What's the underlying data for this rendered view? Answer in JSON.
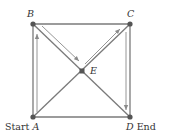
{
  "diagram": {
    "type": "graph-path",
    "nodes": [
      {
        "id": "A",
        "label": "A",
        "prefix": "Start ",
        "x": 33,
        "y": 117
      },
      {
        "id": "B",
        "label": "B",
        "x": 33,
        "y": 24
      },
      {
        "id": "C",
        "label": "C",
        "x": 130,
        "y": 24
      },
      {
        "id": "D",
        "label": "D",
        "suffix": " End",
        "x": 130,
        "y": 117
      },
      {
        "id": "E",
        "label": "E",
        "x": 82,
        "y": 71
      }
    ],
    "edges": [
      [
        "A",
        "B"
      ],
      [
        "B",
        "C"
      ],
      [
        "C",
        "D"
      ],
      [
        "D",
        "A"
      ],
      [
        "A",
        "C"
      ],
      [
        "B",
        "D"
      ]
    ],
    "path": [
      "A",
      "B",
      "E",
      "C",
      "D"
    ],
    "labels": {
      "A_prefix": "Start ",
      "A": "A",
      "B": "B",
      "C": "C",
      "D": "D",
      "D_suffix": " End",
      "E": "E"
    },
    "colors": {
      "edge": "#7a7a7a",
      "node": "#555555",
      "path_arrow": "#8a8a8a",
      "text": "#333333"
    }
  }
}
